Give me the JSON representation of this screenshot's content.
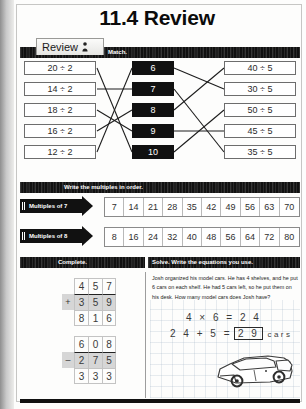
{
  "worksheet": {
    "title": "11.4 Review",
    "tab_label": "Review",
    "tab_icon": "person-icon"
  },
  "match_section": {
    "instruction": "Match.",
    "left_column": [
      "20 ÷ 2",
      "14 ÷ 2",
      "18 ÷ 2",
      "16 ÷ 2",
      "12 ÷ 2"
    ],
    "center_column": [
      "6",
      "7",
      "8",
      "9",
      "10"
    ],
    "right_column": [
      "40 ÷ 5",
      "30 ÷ 5",
      "50 ÷ 5",
      "45 ÷ 5",
      "35 ÷ 5"
    ],
    "left_links": [
      {
        "from": "20 ÷ 2",
        "to": "10"
      },
      {
        "from": "14 ÷ 2",
        "to": "7"
      },
      {
        "from": "18 ÷ 2",
        "to": "9"
      },
      {
        "from": "16 ÷ 2",
        "to": "8"
      },
      {
        "from": "12 ÷ 2",
        "to": "6"
      }
    ],
    "right_links": [
      {
        "from": "8",
        "to": "40 ÷ 5"
      },
      {
        "from": "6",
        "to": "30 ÷ 5"
      },
      {
        "from": "10",
        "to": "50 ÷ 5"
      },
      {
        "from": "9",
        "to": "45 ÷ 5"
      },
      {
        "from": "7",
        "to": "35 ÷ 5"
      }
    ]
  },
  "multiples_section": {
    "instruction": "Write the multiples in order.",
    "rows": [
      {
        "label": "Multiples of 7",
        "values": [
          "7",
          "14",
          "21",
          "28",
          "35",
          "42",
          "49",
          "56",
          "63",
          "70"
        ]
      },
      {
        "label": "Multiples of 8",
        "values": [
          "8",
          "16",
          "24",
          "32",
          "40",
          "48",
          "56",
          "64",
          "72",
          "80"
        ]
      }
    ]
  },
  "complete_section": {
    "instruction": "Complete.",
    "problems": [
      {
        "operation": "+",
        "top": [
          "4",
          "5",
          "7"
        ],
        "bottom": [
          "3",
          "5",
          "9"
        ],
        "answer": [
          "8",
          "1",
          "6"
        ]
      },
      {
        "operation": "–",
        "top": [
          "6",
          "0",
          "8"
        ],
        "bottom": [
          "2",
          "7",
          "5"
        ],
        "answer": [
          "3",
          "3",
          "3"
        ]
      }
    ]
  },
  "solve_section": {
    "instruction": "Solve. Write the equations you use.",
    "word_problem": "Josh organized his model cars. He has 4 shelves, and he put 6 cars on each shelf. He had 5 cars left, so he put them on his desk. How many model cars does Josh have?",
    "equation_1": "4 × 6 = 2 4",
    "equation_2_prefix": "2 4 + 5 =",
    "equation_2_answer": "2 9",
    "equation_2_unit": "cars",
    "illustration": "car-illustration"
  }
}
